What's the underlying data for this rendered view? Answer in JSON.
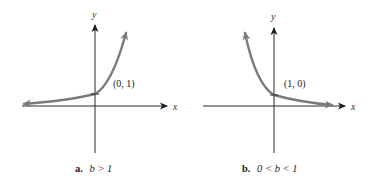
{
  "colors": {
    "axis": "#2a2a2a",
    "curve": "#7a7a7a",
    "background": "#ffffff",
    "text": "#222222"
  },
  "panels": [
    {
      "id": "a",
      "caption_letter": "a.",
      "caption_condition": "b > 1",
      "x_axis_label": "x",
      "y_axis_label": "y",
      "point_label": "(0, 1)",
      "curve": "exponential growth"
    },
    {
      "id": "b",
      "caption_letter": "b.",
      "caption_condition": "0 < b < 1",
      "x_axis_label": "x",
      "y_axis_label": "y",
      "point_label": "(1, 0)",
      "curve": "exponential decay"
    }
  ]
}
